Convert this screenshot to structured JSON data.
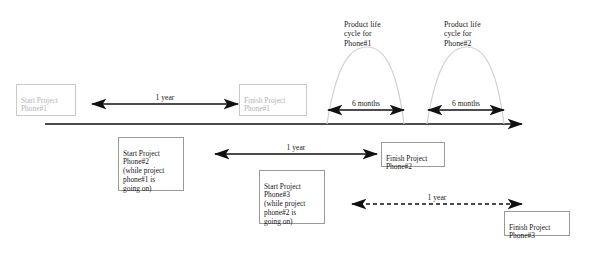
{
  "diagram": {
    "colors": {
      "line": "#111111",
      "curve": "#d0d0d0",
      "light_box_border": "#c9c9c9",
      "light_box_text": "#b4b4b4",
      "dark_box_border": "#9a9a9a",
      "dark_box_text": "#1a1a1a"
    },
    "boxes": [
      {
        "id": "start-phone-1",
        "text": "Start Project\nPhone#1",
        "style": "light"
      },
      {
        "id": "finish-phone-1",
        "text": "Finish  Project\nPhone#1",
        "style": "light"
      },
      {
        "id": "start-phone-2",
        "text": "Start Project\nPhone#2\n(while project\nphone#1 is\ngoing on)",
        "style": "dark"
      },
      {
        "id": "finish-phone-2",
        "text": "Finish Project\nPhone#2",
        "style": "dark"
      },
      {
        "id": "start-phone-3",
        "text": "Start Project\nPhone#3\n(while project\nphone#2 is\ngoing on)",
        "style": "dark"
      },
      {
        "id": "finish-phone-3",
        "text": "Finish Project\nPhone#3",
        "style": "dark"
      }
    ],
    "curve_labels": [
      {
        "id": "lifecycle-1",
        "text": "Product life\ncycle for\nPhone#1"
      },
      {
        "id": "lifecycle-2",
        "text": "Product life\ncycle for\nPhone#2"
      }
    ],
    "arrow_labels": [
      {
        "id": "span-phone-1-duration",
        "text": "1 year",
        "style": "solid"
      },
      {
        "id": "span-lifecycle-1",
        "text": "6 months",
        "style": "solid"
      },
      {
        "id": "span-lifecycle-2",
        "text": "6 months",
        "style": "solid"
      },
      {
        "id": "span-phone-2-duration",
        "text": "1 year",
        "style": "solid"
      },
      {
        "id": "span-phone-3-duration",
        "text": "1 year",
        "style": "dashed"
      }
    ]
  }
}
